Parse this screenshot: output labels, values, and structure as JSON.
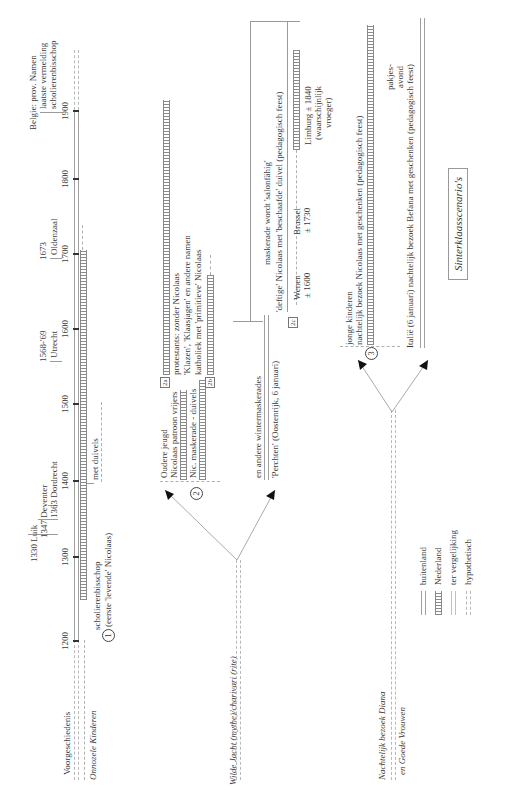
{
  "title": "Sinterklaasscenario's",
  "timeline": {
    "ticks": [
      "1200",
      "1300",
      "1400",
      "1500",
      "1600",
      "1700",
      "1800",
      "1900"
    ],
    "events": [
      {
        "label": "1330 Luik"
      },
      {
        "label": "1347 Deventer"
      },
      {
        "label": "1363 Dordrecht"
      },
      {
        "label": "1568-'69",
        "sub": "Utrecht"
      },
      {
        "label": "1673",
        "sub": "Oldenzaal"
      },
      {
        "label": "Belgie: prov. Namen",
        "sub1": "laatste vermelding",
        "sub2": "scholierenbisschop"
      }
    ]
  },
  "rows": {
    "voorgeschiedenis": "Voorgeschiedenis",
    "onnozele_kinderen": "Onnozele Kinderen",
    "wilde_jacht": "Wilde Jacht (mythe)/charivari (rite)",
    "nachtelijk_1": "Nachtelijk bezoek Diana",
    "nachtelijk_2": "en Goede Vrouwen"
  },
  "scenario1": {
    "number": "1",
    "line1": "scholierenbisschop",
    "line2": "(eerste 'levende' Nicolaas)",
    "duivels": "met duivels"
  },
  "scenario2": {
    "number": "2",
    "jeugd1": "Oudere jeugd",
    "jeugd2": "Nicolaas patroon vrijers",
    "maskerade": "Nic. maskerade - duivels",
    "tag_a": "2a",
    "tag_b": "2b",
    "tag_c": "2c",
    "protestants": "protestants: zonder Nicolaas",
    "klazen": "'Klazen', 'Klaasjagen' en andere namen",
    "katholiek": "katholiek met 'primitieve' Nicolaas",
    "winter": "en andere wintermaskerades",
    "perchten": "'Perchten' (Oostenrijk, 6 januari)",
    "salonfahig": "maskerade wordt 'salonfähig'",
    "deftige": "'deftige' Nicolaas met 'beschaafde' duivel (pedagogisch feest)",
    "wenen1": "Wenen",
    "wenen2": "± 1600",
    "brussel1": "Brussel",
    "brussel2": "± 1730",
    "limburg1": "Limburg ± 1840",
    "limburg2": "(waarschijnlijk",
    "limburg3": "vroeger)"
  },
  "scenario3": {
    "number": "3",
    "kinderen1": "jonge kinderen",
    "kinderen2": "nachtelijk bezoek Nicolaas met geschenken (pedagogisch feest)",
    "italie": "Italië (6 januari) nachtelijk bezoek Befana met geschenken (pedagogisch feest)",
    "pakjes1": "pakjes-",
    "pakjes2": "avond"
  },
  "legend": [
    {
      "style": "double",
      "label": "buitenland"
    },
    {
      "style": "hatched",
      "label": "Nederland"
    },
    {
      "style": "double-thin",
      "label": "ter vergelijking"
    },
    {
      "style": "dashed",
      "label": "hypothetisch"
    }
  ]
}
